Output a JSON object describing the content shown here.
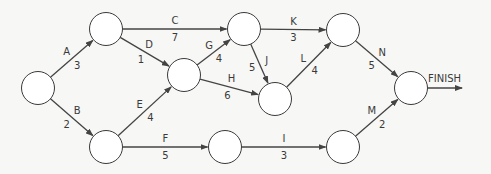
{
  "diagram": {
    "type": "activity-on-arrow network",
    "colors": {
      "line": "#444444",
      "node_fill": "#ffffff",
      "background": "#f7f7f5"
    },
    "nodes": [
      {
        "id": "n1",
        "x": 38,
        "y": 88
      },
      {
        "id": "n2",
        "x": 106,
        "y": 29
      },
      {
        "id": "n3",
        "x": 106,
        "y": 147
      },
      {
        "id": "n4",
        "x": 184,
        "y": 75
      },
      {
        "id": "n5",
        "x": 244,
        "y": 29
      },
      {
        "id": "n6",
        "x": 343,
        "y": 30
      },
      {
        "id": "n7",
        "x": 275,
        "y": 99
      },
      {
        "id": "n8",
        "x": 225,
        "y": 147
      },
      {
        "id": "n9",
        "x": 343,
        "y": 147
      },
      {
        "id": "n10",
        "x": 411,
        "y": 88
      }
    ],
    "activities": [
      {
        "name": "A",
        "duration": "3",
        "from": "n1",
        "to": "n2"
      },
      {
        "name": "B",
        "duration": "2",
        "from": "n1",
        "to": "n3"
      },
      {
        "name": "C",
        "duration": "7",
        "from": "n2",
        "to": "n5"
      },
      {
        "name": "D",
        "duration": "1",
        "from": "n2",
        "to": "n4"
      },
      {
        "name": "E",
        "duration": "4",
        "from": "n3",
        "to": "n4"
      },
      {
        "name": "F",
        "duration": "5",
        "from": "n3",
        "to": "n8"
      },
      {
        "name": "G",
        "duration": "4",
        "from": "n4",
        "to": "n5"
      },
      {
        "name": "H",
        "duration": "6",
        "from": "n4",
        "to": "n7"
      },
      {
        "name": "I",
        "duration": "3",
        "from": "n8",
        "to": "n9"
      },
      {
        "name": "J",
        "duration": "5",
        "from": "n5",
        "to": "n7"
      },
      {
        "name": "K",
        "duration": "3",
        "from": "n5",
        "to": "n6"
      },
      {
        "name": "L",
        "duration": "4",
        "from": "n7",
        "to": "n6"
      },
      {
        "name": "M",
        "duration": "2",
        "from": "n9",
        "to": "n10"
      },
      {
        "name": "N",
        "duration": "5",
        "from": "n6",
        "to": "n10"
      }
    ],
    "finish_label": "FINISH"
  }
}
